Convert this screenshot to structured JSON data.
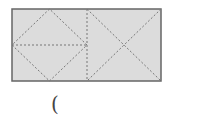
{
  "diagram": {
    "fill_color": "#dcdcdc",
    "border_color": "#666666",
    "dash_color": "#777777",
    "rect": {
      "x": 12,
      "y": 9,
      "width": 149,
      "height": 72
    },
    "divider_x": 87
  },
  "answer_blank": {
    "text": "("
  }
}
